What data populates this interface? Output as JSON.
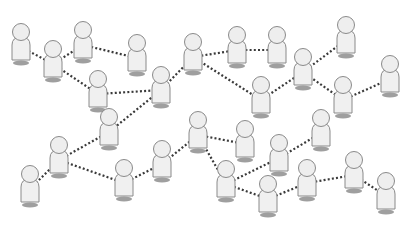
{
  "diagram": {
    "type": "network-of-people",
    "background": "#ffffff",
    "colors": {
      "edge": "#3a3a3a",
      "figure_fill": "#f0f0f0",
      "figure_outline": "#8a8a8a",
      "shadow": "#8e8e8e"
    },
    "edge_style": "dotted",
    "node_icon": "person-icon",
    "nodes": [
      {
        "id": 1,
        "x": 21,
        "y": 35
      },
      {
        "id": 2,
        "x": 53,
        "y": 52
      },
      {
        "id": 3,
        "x": 83,
        "y": 33
      },
      {
        "id": 4,
        "x": 137,
        "y": 46
      },
      {
        "id": 5,
        "x": 98,
        "y": 82
      },
      {
        "id": 6,
        "x": 161,
        "y": 78
      },
      {
        "id": 7,
        "x": 193,
        "y": 45
      },
      {
        "id": 8,
        "x": 237,
        "y": 38
      },
      {
        "id": 9,
        "x": 277,
        "y": 38
      },
      {
        "id": 10,
        "x": 261,
        "y": 88
      },
      {
        "id": 11,
        "x": 303,
        "y": 60
      },
      {
        "id": 12,
        "x": 346,
        "y": 28
      },
      {
        "id": 13,
        "x": 343,
        "y": 88
      },
      {
        "id": 14,
        "x": 390,
        "y": 67
      },
      {
        "id": 15,
        "x": 30,
        "y": 177
      },
      {
        "id": 16,
        "x": 59,
        "y": 148
      },
      {
        "id": 17,
        "x": 109,
        "y": 120
      },
      {
        "id": 18,
        "x": 124,
        "y": 171
      },
      {
        "id": 19,
        "x": 162,
        "y": 152
      },
      {
        "id": 20,
        "x": 198,
        "y": 123
      },
      {
        "id": 21,
        "x": 245,
        "y": 132
      },
      {
        "id": 22,
        "x": 226,
        "y": 172
      },
      {
        "id": 23,
        "x": 279,
        "y": 146
      },
      {
        "id": 24,
        "x": 268,
        "y": 187
      },
      {
        "id": 25,
        "x": 321,
        "y": 121
      },
      {
        "id": 26,
        "x": 307,
        "y": 171
      },
      {
        "id": 27,
        "x": 354,
        "y": 163
      },
      {
        "id": 28,
        "x": 386,
        "y": 184
      }
    ],
    "edges": [
      [
        1,
        2
      ],
      [
        2,
        3
      ],
      [
        2,
        5
      ],
      [
        3,
        4
      ],
      [
        5,
        6
      ],
      [
        6,
        7
      ],
      [
        6,
        17
      ],
      [
        7,
        8
      ],
      [
        7,
        10
      ],
      [
        8,
        9
      ],
      [
        10,
        11
      ],
      [
        11,
        12
      ],
      [
        11,
        13
      ],
      [
        13,
        14
      ],
      [
        15,
        16
      ],
      [
        16,
        17
      ],
      [
        16,
        18
      ],
      [
        18,
        19
      ],
      [
        19,
        20
      ],
      [
        20,
        21
      ],
      [
        20,
        22
      ],
      [
        22,
        23
      ],
      [
        22,
        24
      ],
      [
        23,
        25
      ],
      [
        24,
        26
      ],
      [
        26,
        27
      ],
      [
        27,
        28
      ]
    ]
  }
}
